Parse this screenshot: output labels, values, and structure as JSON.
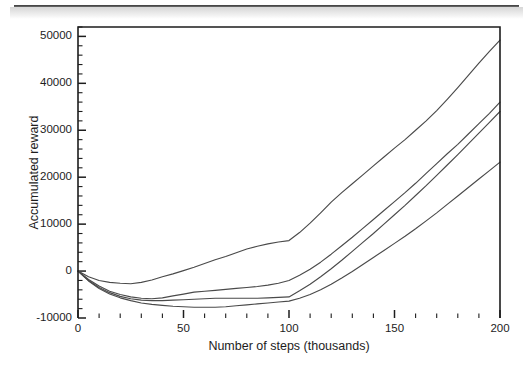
{
  "figure": {
    "artifacts": {
      "top_rule": "scan-rule",
      "top_haze_band": "scan-haze"
    },
    "frame": {
      "left": 78,
      "right": 500,
      "top": 27,
      "bottom": 318
    }
  },
  "chart_data": {
    "type": "line",
    "title": "",
    "xlabel": "Number of steps (thousands)",
    "ylabel": "Accumulated reward",
    "xlim": [
      0,
      200
    ],
    "ylim": [
      -10000,
      52000
    ],
    "grid": false,
    "legend": "none",
    "x_ticks": [
      0,
      50,
      100,
      150,
      200
    ],
    "x_tick_labels": [
      "0",
      "50",
      "100",
      "150",
      "200"
    ],
    "x_minor_step": 10,
    "y_ticks": [
      -10000,
      0,
      10000,
      20000,
      30000,
      40000,
      50000
    ],
    "y_tick_labels": [
      "-10000",
      "0",
      "10000",
      "20000",
      "30000",
      "40000",
      "50000"
    ],
    "y_minor_step": 2000,
    "line_color": "#4a4a4a",
    "x": [
      0,
      5,
      10,
      15,
      20,
      25,
      30,
      35,
      40,
      45,
      50,
      55,
      60,
      65,
      70,
      75,
      80,
      85,
      90,
      95,
      100,
      105,
      110,
      115,
      120,
      125,
      130,
      135,
      140,
      145,
      150,
      155,
      160,
      165,
      170,
      175,
      180,
      185,
      190,
      195,
      200
    ],
    "series": [
      {
        "name": "curve-1",
        "values": [
          0,
          -1200,
          -2000,
          -2400,
          -2600,
          -2700,
          -2400,
          -1900,
          -1200,
          -600,
          100,
          800,
          1600,
          2400,
          3100,
          3900,
          4700,
          5300,
          5800,
          6200,
          6500,
          8200,
          10200,
          12400,
          14700,
          16700,
          18600,
          20500,
          22400,
          24300,
          26200,
          28000,
          30000,
          32000,
          34200,
          36600,
          39100,
          41700,
          44300,
          46800,
          49200
        ]
      },
      {
        "name": "curve-2",
        "values": [
          0,
          -1800,
          -3200,
          -4300,
          -5000,
          -5500,
          -5800,
          -5900,
          -5700,
          -5300,
          -4900,
          -4500,
          -4300,
          -4100,
          -3900,
          -3700,
          -3500,
          -3300,
          -3000,
          -2600,
          -2000,
          -900,
          400,
          1900,
          3600,
          5400,
          7200,
          9100,
          11000,
          12900,
          14800,
          16700,
          18700,
          20800,
          22900,
          25000,
          27000,
          29200,
          31400,
          33600,
          36000
        ]
      },
      {
        "name": "curve-3",
        "values": [
          0,
          -2000,
          -3500,
          -4600,
          -5400,
          -5900,
          -6200,
          -6300,
          -6300,
          -6200,
          -6100,
          -6000,
          -5900,
          -5800,
          -5800,
          -5800,
          -5800,
          -5800,
          -5700,
          -5600,
          -5500,
          -4200,
          -2800,
          -1200,
          500,
          2300,
          4200,
          6100,
          8000,
          10000,
          12000,
          14000,
          16100,
          18200,
          20400,
          22600,
          24800,
          27100,
          29400,
          31700,
          34000
        ]
      },
      {
        "name": "curve-4",
        "values": [
          0,
          -2100,
          -3700,
          -4900,
          -5700,
          -6300,
          -6800,
          -7100,
          -7300,
          -7500,
          -7600,
          -7700,
          -7700,
          -7700,
          -7600,
          -7400,
          -7200,
          -7000,
          -6800,
          -6600,
          -6400,
          -5800,
          -5000,
          -4000,
          -2800,
          -1500,
          -100,
          1400,
          2900,
          4400,
          5900,
          7400,
          9000,
          10700,
          12400,
          14200,
          16000,
          17800,
          19600,
          21400,
          23200
        ]
      }
    ]
  }
}
